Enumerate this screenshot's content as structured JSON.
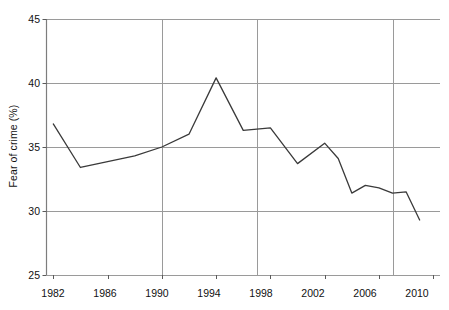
{
  "chart_data": {
    "type": "line",
    "title": "",
    "xlabel": "",
    "ylabel": "Fear of crime (%)",
    "xlim": [
      1981.5,
      2010.5
    ],
    "ylim": [
      25,
      45
    ],
    "yticks": [
      25,
      30,
      35,
      40,
      45
    ],
    "xticks": [
      1982,
      1986,
      1990,
      1994,
      1998,
      2002,
      2006,
      2010
    ],
    "grid": {
      "horizontal": [
        25,
        30,
        35,
        40,
        45
      ],
      "vertical": [
        1990,
        1997,
        2007
      ],
      "color": "#9a9a9a"
    },
    "legend": null,
    "series": [
      {
        "name": "Fear of crime",
        "color": "#3a3a3a",
        "x": [
          1982,
          1984,
          1988,
          1990,
          1992,
          1994,
          1996,
          1998,
          2000,
          2002,
          2003,
          2004,
          2005,
          2006,
          2007,
          2008,
          2009
        ],
        "values": [
          36.8,
          33.4,
          34.3,
          35.0,
          36.0,
          40.4,
          36.3,
          36.5,
          33.7,
          35.3,
          34.1,
          31.4,
          32.0,
          31.8,
          31.4,
          31.5,
          29.3
        ]
      }
    ]
  },
  "axis": {
    "y_tick_labels": [
      "45",
      "40",
      "35",
      "30",
      "25"
    ],
    "x_tick_labels": [
      "1982",
      "1986",
      "1990",
      "1994",
      "1998",
      "2002",
      "2006",
      "2010"
    ],
    "y_axis_title": "Fear of crime (%)"
  }
}
